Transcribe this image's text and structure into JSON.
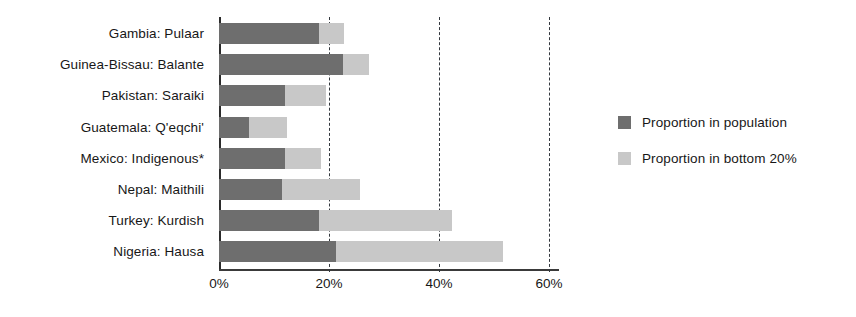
{
  "chart_data": {
    "type": "bar",
    "orientation": "horizontal",
    "stacked": true,
    "title": "",
    "subtitle": "",
    "xlabel": "",
    "ylabel": "",
    "xlim": [
      0,
      64
    ],
    "ylim": null,
    "grid": true,
    "grid_style": "dashed-vertical",
    "legend_position": "right",
    "categories": [
      "Gambia: Pulaar",
      "Guinea-Bissau: Balante",
      "Pakistan: Saraiki",
      "Guatemala: Q'eqchi'",
      "Mexico: Indigenous*",
      "Nepal: Maithili",
      "Turkey: Kurdish",
      "Nigeria: Hausa"
    ],
    "series": [
      {
        "name": "Proportion in population",
        "color": "#6e6e6e",
        "values": [
          18.2,
          22.5,
          12.0,
          5.4,
          12.0,
          11.4,
          18.2,
          21.3
        ]
      },
      {
        "name": "Proportion in bottom 20%",
        "color": "#c8c8c8",
        "values": [
          22.7,
          27.2,
          19.5,
          12.4,
          18.6,
          25.7,
          42.4,
          51.6
        ]
      }
    ],
    "xticks": [
      0,
      20,
      40,
      60
    ],
    "xticklabels": [
      "0%",
      "20%",
      "40%",
      "60%"
    ],
    "annotations": [
      "*"
    ]
  },
  "legend": {
    "items": [
      {
        "label": "Proportion in population",
        "color": "#6e6e6e"
      },
      {
        "label": "Proportion in bottom 20%",
        "color": "#c8c8c8"
      }
    ]
  },
  "colors": {
    "series_dark": "#6e6e6e",
    "series_light": "#c8c8c8",
    "axis": "#2b2b2b",
    "grid": "#33383e",
    "text": "#171717",
    "background": "#ffffff"
  }
}
